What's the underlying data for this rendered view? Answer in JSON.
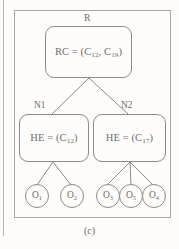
{
  "figure": {
    "caption": "(c)",
    "type": "hierarchical-tree-diagram",
    "stroke_color": "#8d8a87",
    "frame_color": "#a9a6a3",
    "background_color": "#fdfcfa",
    "text_color": "#6f6d6b"
  },
  "tree": {
    "root": {
      "label": "R",
      "prefix": "RC = (C",
      "sub1": "12",
      "mid": ", C",
      "sub2": "19",
      "suffix": ")",
      "full_text": "RC = (C12, C19)"
    },
    "branches": [
      {
        "label": "N1",
        "prefix": "HE = (C",
        "sub1": "12",
        "suffix": ")",
        "full_text": "HE = (C12)"
      },
      {
        "label": "N2",
        "prefix": "HE = (C",
        "sub1": "17",
        "suffix": ")",
        "full_text": "HE = (C17)"
      }
    ],
    "leaves": [
      {
        "prefix": "O",
        "sub": "1",
        "full_text": "O1",
        "parent": "N1"
      },
      {
        "prefix": "O",
        "sub": "2",
        "full_text": "O2",
        "parent": "N1"
      },
      {
        "prefix": "O",
        "sub": "3",
        "full_text": "O3",
        "parent": "N2"
      },
      {
        "prefix": "O",
        "sub": "5",
        "full_text": "O5",
        "parent": "N2"
      },
      {
        "prefix": "O",
        "sub": "4",
        "full_text": "O4",
        "parent": "N2"
      }
    ]
  }
}
